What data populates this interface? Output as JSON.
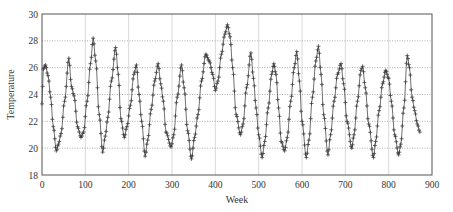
{
  "chart_data": {
    "type": "line",
    "title": "",
    "xlabel": "Week",
    "ylabel": "Temperature",
    "xlim": [
      0,
      900
    ],
    "ylim": [
      18,
      30
    ],
    "xticks": [
      0,
      100,
      200,
      300,
      400,
      500,
      600,
      700,
      800,
      900
    ],
    "yticks": [
      18,
      20,
      22,
      24,
      26,
      28,
      30
    ],
    "grid": {
      "x": true,
      "y": true,
      "x_style": "solid-light",
      "y_style": "dotted"
    },
    "legend": null,
    "marker": "plus",
    "line_color": "#333333",
    "series": [
      {
        "name": "Temperature",
        "points": [
          [
            0,
            23.3
          ],
          [
            3,
            25.9
          ],
          [
            8,
            26.2
          ],
          [
            14,
            25.4
          ],
          [
            20,
            23.8
          ],
          [
            26,
            21.6
          ],
          [
            33,
            19.8
          ],
          [
            38,
            20.3
          ],
          [
            44,
            21.1
          ],
          [
            52,
            23.5
          ],
          [
            62,
            26.7
          ],
          [
            68,
            24.6
          ],
          [
            74,
            23.9
          ],
          [
            82,
            21.6
          ],
          [
            90,
            20.8
          ],
          [
            96,
            21.2
          ],
          [
            104,
            23.5
          ],
          [
            112,
            26.3
          ],
          [
            118,
            28.2
          ],
          [
            124,
            26.5
          ],
          [
            132,
            22.5
          ],
          [
            140,
            19.7
          ],
          [
            146,
            20.9
          ],
          [
            152,
            22.3
          ],
          [
            160,
            25.0
          ],
          [
            170,
            27.5
          ],
          [
            176,
            25.5
          ],
          [
            182,
            22.2
          ],
          [
            190,
            20.8
          ],
          [
            196,
            21.6
          ],
          [
            204,
            23.2
          ],
          [
            212,
            25.5
          ],
          [
            218,
            26.2
          ],
          [
            224,
            24.0
          ],
          [
            230,
            22.0
          ],
          [
            238,
            19.4
          ],
          [
            244,
            20.6
          ],
          [
            252,
            22.9
          ],
          [
            260,
            25.0
          ],
          [
            268,
            26.3
          ],
          [
            274,
            24.8
          ],
          [
            280,
            23.5
          ],
          [
            286,
            21.2
          ],
          [
            298,
            20.1
          ],
          [
            304,
            21.0
          ],
          [
            312,
            23.8
          ],
          [
            322,
            26.2
          ],
          [
            328,
            24.5
          ],
          [
            336,
            21.3
          ],
          [
            345,
            19.2
          ],
          [
            352,
            20.8
          ],
          [
            360,
            22.5
          ],
          [
            368,
            25.0
          ],
          [
            378,
            27.0
          ],
          [
            386,
            26.5
          ],
          [
            394,
            25.5
          ],
          [
            400,
            24.3
          ],
          [
            406,
            25.0
          ],
          [
            414,
            27.0
          ],
          [
            422,
            28.5
          ],
          [
            428,
            29.2
          ],
          [
            434,
            28.3
          ],
          [
            440,
            26.0
          ],
          [
            448,
            22.5
          ],
          [
            458,
            21.0
          ],
          [
            464,
            21.8
          ],
          [
            472,
            24.5
          ],
          [
            482,
            27.1
          ],
          [
            488,
            25.2
          ],
          [
            494,
            23.0
          ],
          [
            500,
            21.0
          ],
          [
            508,
            19.3
          ],
          [
            514,
            20.5
          ],
          [
            522,
            23.0
          ],
          [
            530,
            25.5
          ],
          [
            535,
            26.3
          ],
          [
            540,
            25.5
          ],
          [
            546,
            23.0
          ],
          [
            552,
            20.5
          ],
          [
            560,
            19.8
          ],
          [
            566,
            20.8
          ],
          [
            574,
            23.5
          ],
          [
            582,
            26.0
          ],
          [
            588,
            27.2
          ],
          [
            594,
            25.0
          ],
          [
            600,
            22.0
          ],
          [
            610,
            19.3
          ],
          [
            616,
            20.6
          ],
          [
            624,
            23.8
          ],
          [
            632,
            26.5
          ],
          [
            638,
            27.6
          ],
          [
            644,
            25.5
          ],
          [
            650,
            22.5
          ],
          [
            660,
            19.5
          ],
          [
            666,
            21.0
          ],
          [
            674,
            23.5
          ],
          [
            682,
            25.5
          ],
          [
            690,
            26.3
          ],
          [
            696,
            24.8
          ],
          [
            704,
            22.0
          ],
          [
            715,
            20.0
          ],
          [
            720,
            21.0
          ],
          [
            728,
            23.5
          ],
          [
            736,
            25.8
          ],
          [
            740,
            26.1
          ],
          [
            746,
            24.5
          ],
          [
            754,
            21.8
          ],
          [
            765,
            19.3
          ],
          [
            770,
            20.5
          ],
          [
            778,
            22.8
          ],
          [
            786,
            24.8
          ],
          [
            793,
            25.8
          ],
          [
            800,
            25.2
          ],
          [
            806,
            23.5
          ],
          [
            814,
            21.0
          ],
          [
            823,
            19.5
          ],
          [
            828,
            20.3
          ],
          [
            835,
            23.0
          ],
          [
            843,
            26.9
          ],
          [
            848,
            26.0
          ],
          [
            854,
            23.8
          ],
          [
            860,
            22.8
          ],
          [
            866,
            21.8
          ],
          [
            872,
            21.2
          ]
        ]
      }
    ]
  }
}
